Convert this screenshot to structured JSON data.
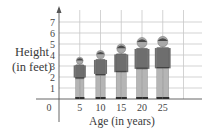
{
  "chart_data": {
    "type": "bar",
    "title": "",
    "xlabel": "Age (in years)",
    "ylabel_line1": "Height",
    "ylabel_line2": "(in feet)",
    "categories": [
      "5",
      "10",
      "15",
      "20",
      "25"
    ],
    "values": [
      3.8,
      4.4,
      5.0,
      5.6,
      5.7
    ],
    "value_representation": "pictograph of a person whose height equals the value",
    "x_ticks": [
      "0",
      "5",
      "10",
      "15",
      "20",
      "25"
    ],
    "y_ticks": [
      "1",
      "2",
      "3",
      "4",
      "5",
      "6",
      "7"
    ],
    "ylim": [
      0,
      7.5
    ],
    "xlim": [
      0,
      30
    ],
    "grid": true,
    "legend": null
  },
  "colors": {
    "grid": "#c8c8c8",
    "axis": "#555555",
    "figure_shirt": "#6e6e6e",
    "figure_pants": "#b5b5b5",
    "figure_skin": "#a8a8a8",
    "figure_hair": "#4a4a4a"
  }
}
